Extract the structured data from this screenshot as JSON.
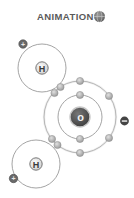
{
  "title": "ANIMATION",
  "icons": {
    "title_icon": "globe-icon"
  },
  "atoms": {
    "oxygen": {
      "symbol": "O",
      "nucleus_label": "o",
      "charge": "−"
    },
    "hydrogen_top": {
      "symbol": "H",
      "charge": "+"
    },
    "hydrogen_bottom": {
      "symbol": "H",
      "charge": "+"
    }
  },
  "colors": {
    "shell": "#9a9a9a",
    "electron": "#b5b5b5",
    "electron_stroke": "#8a8a8a",
    "oxygen_nucleus": "#555555",
    "hydrogen_nucleus": "#e6e6e6",
    "charge_badge": "#555555",
    "text": "#5a5a5a"
  }
}
